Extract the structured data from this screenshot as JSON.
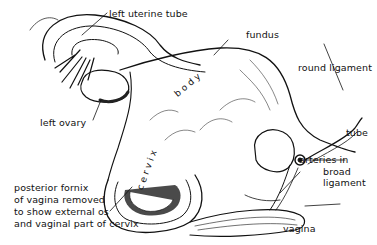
{
  "figure": {
    "type": "anatomical illustration"
  },
  "labels": {
    "left_uterine_tube": "left uterine tube",
    "fundus": "fundus",
    "round_ligament": "round ligament",
    "left_ovary": "left ovary",
    "tube": "tube",
    "arteries_line1": "arteries in",
    "arteries_line2": "broad",
    "arteries_line3": "ligament",
    "posterior_line1": "posterior fornix",
    "posterior_line2": "of vagina removed",
    "posterior_line3": "to show external os",
    "posterior_line4": "and vaginal part of cervix",
    "vagina": "vagina"
  },
  "inline_words": {
    "body": "b o d y",
    "cervix": "c e r v i x"
  },
  "colors": {
    "ink": "#111111",
    "background": "#ffffff",
    "shade": "#2a2a2a"
  }
}
